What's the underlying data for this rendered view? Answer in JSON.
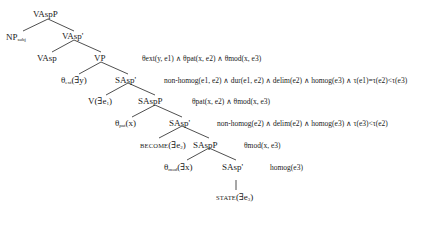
{
  "tree": {
    "nodes": {
      "root": "VAspP",
      "np_subj": "NP",
      "np_subj_sub": "subj",
      "vasp_bar": "VAsp'",
      "vasp": "VAsp",
      "vp": "VP",
      "theta_ext": "θ",
      "theta_ext_sub": "ext",
      "theta_ext_arg": "(∃y)",
      "sasp_bar_1": "SAsp'",
      "v_e1": "V(∃e",
      "v_e1_sub": "1",
      "v_e1_close": ")",
      "saspp_1": "SAspP",
      "theta_pat": "θ",
      "theta_pat_sub": "pat",
      "theta_pat_arg": "(x)",
      "sasp_bar_2": "SAsp'",
      "become_label": "BECOME",
      "become_arg": "(∃e",
      "become_sub": "2",
      "become_close": ")",
      "saspp_2": "SAspP",
      "theta_mod": "θ",
      "theta_mod_sub": "mod",
      "theta_mod_arg": "(∃x)",
      "sasp_bar_3": "SAsp'",
      "state_label": "STATE",
      "state_arg": "(∃e",
      "state_sub": "3",
      "state_close": ")"
    },
    "formulas": {
      "vp": "θext(y, e1) ∧ θpat(x, e2) ∧ θmod(x, e3)",
      "sasp_bar_1": "non-homog(e1, e2) ∧ dur(e1, e2) ∧ delim(e2) ∧ homog(e3) ∧ τ(e1)=τ(e2)<τ(e3)",
      "saspp_1": "θpat(x, e2) ∧ θmod(x, e3)",
      "sasp_bar_2": "non-homog(e2) ∧ delim(e2) ∧ homog(e3) ∧ τ(e3)<τ(e2)",
      "saspp_2": "θmod(x, e3)",
      "sasp_bar_3": "homog(e3)"
    }
  }
}
